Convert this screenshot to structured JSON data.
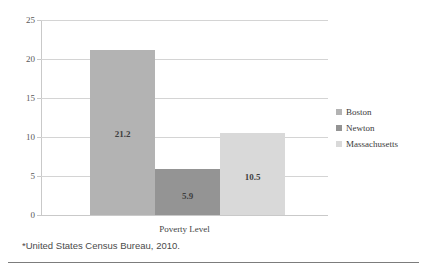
{
  "chart_data": {
    "type": "bar",
    "title": "",
    "xlabel": "Poverty Level",
    "ylabel": "",
    "categories": [
      "Poverty Level"
    ],
    "ylim": [
      0,
      25
    ],
    "ytick_labels": [
      "0",
      "5",
      "10",
      "15",
      "20",
      "25"
    ],
    "ytick_values": [
      0,
      5,
      10,
      15,
      20,
      25
    ],
    "grid": true,
    "legend_position": "right",
    "series": [
      {
        "name": "Boston",
        "values": [
          21.2
        ],
        "label": "21.2",
        "color": "#b3b3b3"
      },
      {
        "name": "Newton",
        "values": [
          5.9
        ],
        "label": "5.9",
        "color": "#949494"
      },
      {
        "name": "Massachusetts",
        "values": [
          10.5
        ],
        "label": "10.5",
        "color": "#d9d9d9"
      }
    ]
  },
  "footnote": "*United States Census Bureau, 2010.",
  "legend": {
    "items": [
      {
        "label": "Boston"
      },
      {
        "label": "Newton"
      },
      {
        "label": "Massachusetts"
      }
    ]
  },
  "colors": {
    "boston": "#b3b3b3",
    "newton": "#949494",
    "massachusetts": "#d9d9d9",
    "gridline": "#d4d4d4",
    "axis": "#c9c9c9",
    "rule": "#7c7c7c",
    "text": "#3b3b3b"
  }
}
